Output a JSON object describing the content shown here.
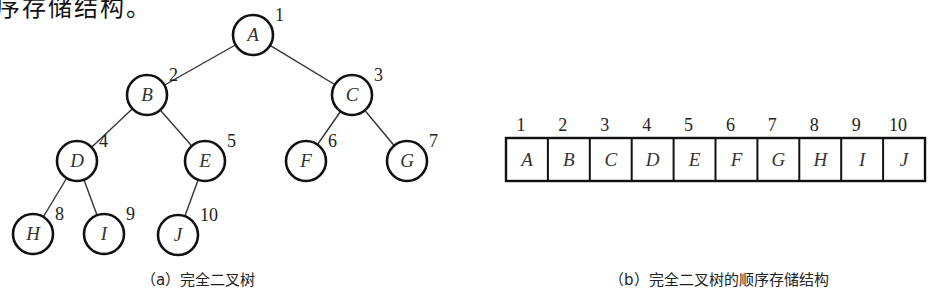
{
  "header_fragment": "序存储结构。",
  "tree": {
    "nodes": [
      {
        "label": "A",
        "index": "1",
        "cx": 253,
        "cy": 35
      },
      {
        "label": "B",
        "index": "2",
        "cx": 147,
        "cy": 95
      },
      {
        "label": "C",
        "index": "3",
        "cx": 352,
        "cy": 95
      },
      {
        "label": "D",
        "index": "4",
        "cx": 77,
        "cy": 161
      },
      {
        "label": "E",
        "index": "5",
        "cx": 205,
        "cy": 161
      },
      {
        "label": "F",
        "index": "6",
        "cx": 306,
        "cy": 161
      },
      {
        "label": "G",
        "index": "7",
        "cx": 407,
        "cy": 161
      },
      {
        "label": "H",
        "index": "8",
        "cx": 33,
        "cy": 234
      },
      {
        "label": "I",
        "index": "9",
        "cx": 104,
        "cy": 234
      },
      {
        "label": "J",
        "index": "10",
        "cx": 178,
        "cy": 235
      }
    ],
    "caption": "（a）完全二叉树"
  },
  "array": {
    "indices": [
      "1",
      "2",
      "3",
      "4",
      "5",
      "6",
      "7",
      "8",
      "9",
      "10"
    ],
    "cells": [
      "A",
      "B",
      "C",
      "D",
      "E",
      "F",
      "G",
      "H",
      "I",
      "J"
    ],
    "caption": "（b）完全二叉树的顺序存储结构"
  }
}
